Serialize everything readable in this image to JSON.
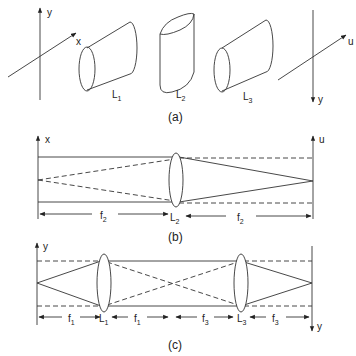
{
  "figure": {
    "panel_a": {
      "caption": "(a)",
      "left_axes": {
        "vertical": "y",
        "oblique": "x"
      },
      "right_axes": {
        "vertical": "y",
        "oblique": "u"
      },
      "lenses": [
        {
          "label": "L",
          "sub": "1",
          "orientation": "cylinder along x"
        },
        {
          "label": "L",
          "sub": "2",
          "orientation": "cylinder along y"
        },
        {
          "label": "L",
          "sub": "3",
          "orientation": "cylinder along x"
        }
      ]
    },
    "panel_b": {
      "caption": "(b)",
      "left_axis": "x",
      "right_axis": "u",
      "lens": {
        "label": "L",
        "sub": "2"
      },
      "distances": [
        {
          "label": "f",
          "sub": "2"
        },
        {
          "label": "f",
          "sub": "2"
        }
      ]
    },
    "panel_c": {
      "caption": "(c)",
      "left_axis": "y",
      "right_axis": "y",
      "lenses": [
        {
          "label": "L",
          "sub": "1"
        },
        {
          "label": "L",
          "sub": "3"
        }
      ],
      "distances": [
        {
          "label": "f",
          "sub": "1"
        },
        {
          "label": "f",
          "sub": "1"
        },
        {
          "label": "f",
          "sub": "3"
        },
        {
          "label": "f",
          "sub": "3"
        }
      ]
    }
  }
}
